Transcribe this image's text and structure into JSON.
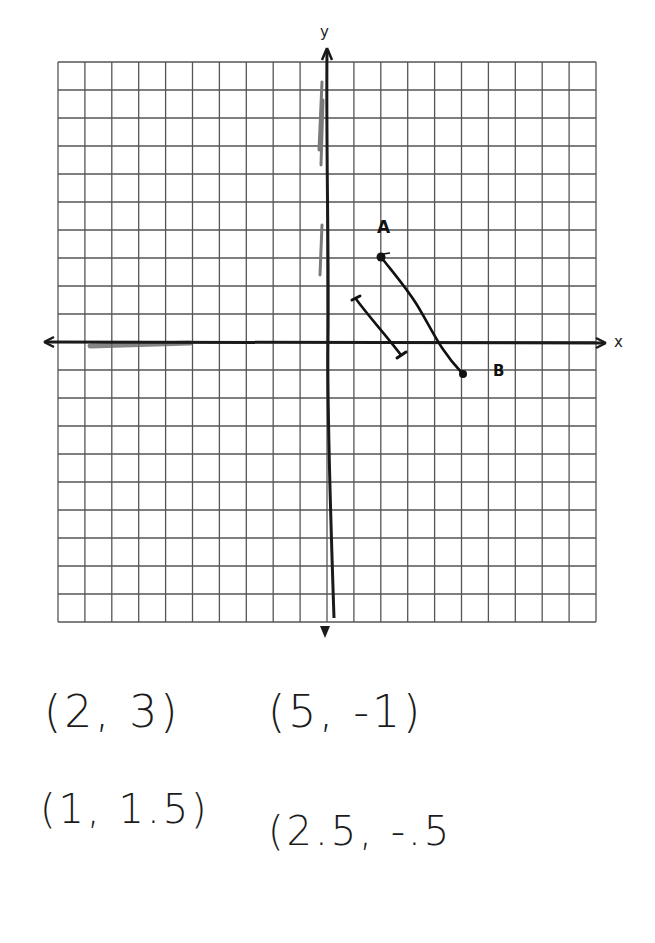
{
  "axes": {
    "x_label": "x",
    "y_label": "y",
    "grid": {
      "columns": 20,
      "rows": 20,
      "x_min": -10,
      "x_max": 10,
      "y_min": -10,
      "y_max": 10,
      "unit": 1
    },
    "colors": {
      "grid": "#555555",
      "axis": "#1a1a1a",
      "pencil": "#777777",
      "ink": "#111111"
    }
  },
  "points": {
    "A": {
      "label": "A",
      "x": 2,
      "y": 3
    },
    "B": {
      "label": "B",
      "x": 5,
      "y": -1
    }
  },
  "segments": [
    {
      "name": "segment-AB",
      "from": {
        "x": 2,
        "y": 3
      },
      "to": {
        "x": 5,
        "y": -1
      },
      "endpoints": "dots"
    },
    {
      "name": "segment-small",
      "from": {
        "x": 1,
        "y": 1.5
      },
      "to": {
        "x": 2.5,
        "y": -0.5
      },
      "endpoints": "ticks"
    }
  ],
  "notes": {
    "coord_1": "(2, 3)",
    "coord_2": "(5, -1)",
    "coord_3": "(1, 1.5)",
    "coord_4": "(2.5, -.5"
  }
}
